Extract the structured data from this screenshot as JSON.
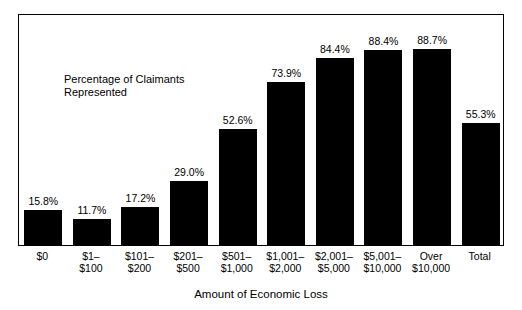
{
  "chart_data": {
    "type": "bar",
    "title": "",
    "xlabel": "Amount of Economic Loss",
    "ylabel": "",
    "annotation": "Percentage of Claimants\nRepresented",
    "ylim": [
      0,
      100
    ],
    "grid": false,
    "legend": "none",
    "categories": [
      "$0",
      "$1–\n$100",
      "$101–\n$200",
      "$201–\n$500",
      "$501–\n$1,000",
      "$1,001–\n$2,000",
      "$2,001–\n$5,000",
      "$5,001–\n$10,000",
      "Over\n$10,000",
      "Total"
    ],
    "values": [
      15.8,
      11.7,
      17.2,
      29.0,
      52.6,
      73.9,
      84.4,
      88.4,
      88.7,
      55.3
    ],
    "value_labels": [
      "15.8%",
      "11.7%",
      "17.2%",
      "29.0%",
      "52.6%",
      "73.9%",
      "84.4%",
      "88.4%",
      "88.7%",
      "55.3%"
    ],
    "bar_color": "#000000",
    "frame_color": "#000000",
    "background": "#ffffff"
  }
}
